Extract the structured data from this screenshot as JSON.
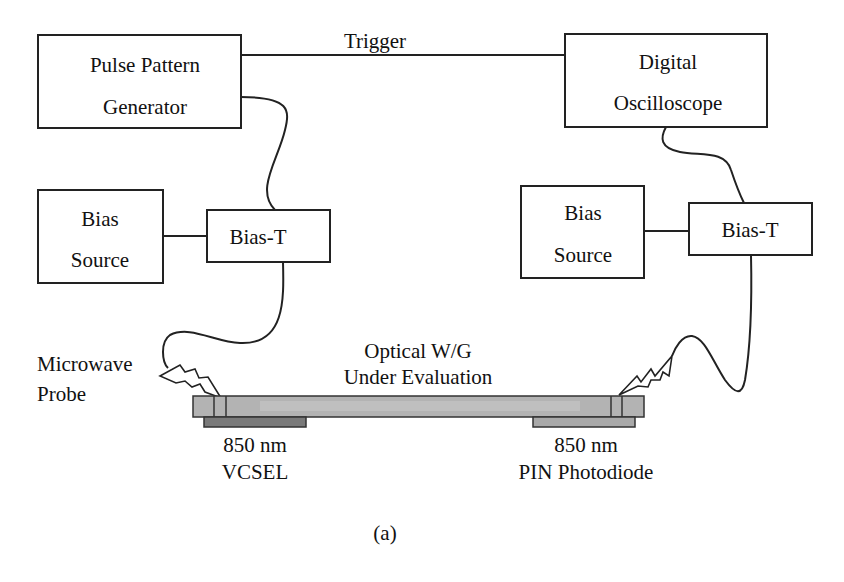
{
  "diagram": {
    "caption": "(a)",
    "trigger_label": "Trigger",
    "blocks": {
      "pulse_pattern_generator": {
        "line1": "Pulse Pattern",
        "line2": "Generator"
      },
      "digital_oscilloscope": {
        "line1": "Digital",
        "line2": "Oscilloscope"
      },
      "bias_source_left": {
        "line1": "Bias",
        "line2": "Source"
      },
      "bias_t_left": {
        "label": "Bias-T"
      },
      "bias_source_right": {
        "line1": "Bias",
        "line2": "Source"
      },
      "bias_t_right": {
        "label": "Bias-T"
      }
    },
    "probe_label": {
      "line1": "Microwave",
      "line2": "Probe"
    },
    "waveguide_label": {
      "line1": "Optical W/G",
      "line2": "Under Evaluation"
    },
    "vcsel_label": {
      "line1": "850 nm",
      "line2": "VCSEL"
    },
    "photodiode_label": {
      "line1": "850 nm",
      "line2": "PIN Photodiode"
    },
    "colors": {
      "waveguide": "#b3b3b3",
      "waveguide_core": "#c6c6c6",
      "vcsel_pad": "#7a7a7a",
      "photodiode_pad": "#a9a9a9",
      "line": "#222222"
    },
    "connections": [
      {
        "from": "Pulse Pattern Generator",
        "to": "Digital Oscilloscope",
        "label": "Trigger"
      },
      {
        "from": "Pulse Pattern Generator",
        "to": "Bias-T (left)"
      },
      {
        "from": "Bias Source (left)",
        "to": "Bias-T (left)"
      },
      {
        "from": "Bias-T (left)",
        "to": "Microwave Probe (VCSEL)"
      },
      {
        "from": "Digital Oscilloscope",
        "to": "Bias-T (right)"
      },
      {
        "from": "Bias Source (right)",
        "to": "Bias-T (right)"
      },
      {
        "from": "Bias-T (right)",
        "to": "Microwave Probe (Photodiode)"
      }
    ]
  }
}
